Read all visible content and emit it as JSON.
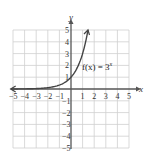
{
  "chart_data": {
    "type": "line",
    "title": "",
    "xlabel": "x",
    "ylabel": "y",
    "xlim": [
      -5,
      5
    ],
    "ylim": [
      -5,
      5
    ],
    "grid": true,
    "x_ticks": [
      -5,
      -4,
      -3,
      -2,
      -1,
      1,
      2,
      3,
      4,
      5
    ],
    "y_ticks": [
      -5,
      -4,
      -3,
      -2,
      -1,
      1,
      2,
      3,
      4,
      5
    ],
    "series": [
      {
        "name": "f(x) = 3^x",
        "function": "3^x",
        "x": [
          -5,
          -4,
          -3,
          -2,
          -1,
          0,
          0.5,
          1,
          1.25,
          1.465
        ],
        "y": [
          0.004,
          0.012,
          0.037,
          0.111,
          0.333,
          1,
          1.732,
          3,
          3.948,
          5
        ],
        "left_arrow": true,
        "right_arrow": true
      }
    ],
    "annotations": [
      {
        "text": "f(x) = 3",
        "superscript": "x",
        "x": 0.9,
        "y": 2
      }
    ]
  },
  "labels": {
    "x_axis": "x",
    "y_axis": "y",
    "function_main": "f(x) = 3",
    "function_sup": "x"
  },
  "colors": {
    "grid": "#cfcfcf",
    "axis": "#555555",
    "curve": "#444444",
    "text": "#333333"
  }
}
